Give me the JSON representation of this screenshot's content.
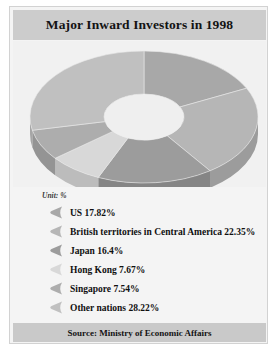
{
  "card": {
    "title": "Major Inward Investors in 1998",
    "unit_label": "Unit: %",
    "footer": "Source: Ministry of Economic Affairs"
  },
  "chart_data": {
    "type": "pie",
    "variant": "donut-3d",
    "title": "Major Inward Investors in 1998",
    "unit": "%",
    "source": "Source: Ministry of Economic Affairs",
    "legend_position": "bottom",
    "grid": false,
    "categories": [
      "US",
      "British territories in Central America",
      "Japan",
      "Hong Kong",
      "Singapore",
      "Other nations"
    ],
    "values": [
      17.82,
      22.35,
      16.4,
      7.67,
      7.54,
      28.22
    ],
    "slice_labels": [
      "US 17.82%",
      "British territories in Central America 22.35%",
      "Japan 16.4%",
      "Hong Kong 7.67%",
      "Singapore 7.54%",
      "Other nations 28.22%"
    ],
    "colors": [
      "#a8a8a8",
      "#b6b6b6",
      "#9c9c9c",
      "#d8d8d8",
      "#adadad",
      "#c0c0c0"
    ],
    "side_colors": [
      "#8f8f8f",
      "#9c9c9c",
      "#858585",
      "#bcbcbc",
      "#949494",
      "#a6a6a6"
    ]
  },
  "legend": [
    {
      "label": "US 17.82%",
      "color": "#a8a8a8"
    },
    {
      "label": "British territories in Central America 22.35%",
      "color": "#b6b6b6"
    },
    {
      "label": "Japan 16.4%",
      "color": "#9c9c9c"
    },
    {
      "label": "Hong Kong 7.67%",
      "color": "#d8d8d8"
    },
    {
      "label": "Singapore 7.54%",
      "color": "#adadad"
    },
    {
      "label": "Other nations 28.22%",
      "color": "#c0c0c0"
    }
  ]
}
